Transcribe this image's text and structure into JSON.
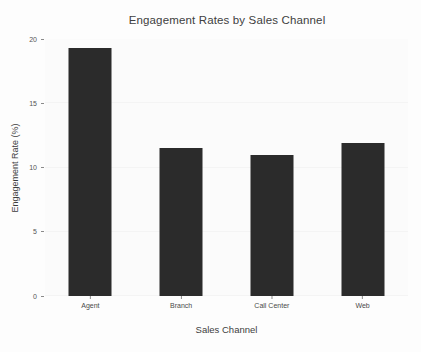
{
  "chart_data": {
    "type": "bar",
    "title": "Engagement Rates by Sales Channel",
    "xlabel": "Sales Channel",
    "ylabel": "Engagement Rate (%)",
    "categories": [
      "Agent",
      "Branch",
      "Call Center",
      "Web"
    ],
    "values": [
      19.3,
      11.5,
      11.0,
      11.9
    ],
    "ylim": [
      0,
      20
    ],
    "yticks": [
      0,
      5,
      10,
      15,
      20
    ],
    "ytick_labels": [
      "0",
      "5",
      "10",
      "15",
      "20"
    ],
    "grid": true,
    "legend": null,
    "bar_color": "#2b2b2b",
    "background_color": "#fbfbfb"
  }
}
